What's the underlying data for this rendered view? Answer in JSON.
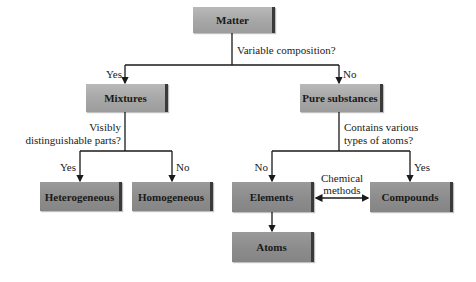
{
  "diagram": {
    "nodes": {
      "matter": "Matter",
      "mixtures": "Mixtures",
      "pure_substances": "Pure substances",
      "heterogeneous": "Heterogeneous",
      "homogeneous": "Homogeneous",
      "elements": "Elements",
      "compounds": "Compounds",
      "atoms": "Atoms"
    },
    "questions": {
      "q1": "Variable composition?",
      "q2_line1": "Visibly",
      "q2_line2": "distinguishable parts?",
      "q3_line1": "Contains various",
      "q3_line2": "types of atoms?"
    },
    "edge_labels": {
      "matter_yes": "Yes",
      "matter_no": "No",
      "mixtures_yes": "Yes",
      "mixtures_no": "No",
      "pure_no": "No",
      "pure_yes": "Yes",
      "chem_line1": "Chemical",
      "chem_line2": "methods"
    },
    "colors": {
      "box_light": "#a8a8a8",
      "box_dark": "#8c8c8c",
      "line": "#1a1a1a",
      "background": "#ffffff"
    }
  }
}
